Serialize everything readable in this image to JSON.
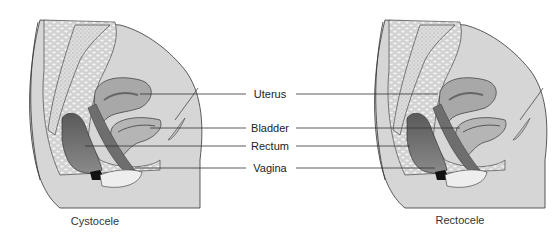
{
  "labels": {
    "uterus": "Uterus",
    "bladder": "Bladder",
    "rectum": "Rectum",
    "vagina": "Vagina"
  },
  "captions": {
    "left": "Cystocele",
    "right": "Rectocele"
  },
  "colors": {
    "body_fill": "#d6d6d6",
    "fat_fill": "#e8e8e8",
    "organ_mid": "#a8a8a8",
    "organ_dark": "#6e6e6e",
    "line": "#333333"
  }
}
